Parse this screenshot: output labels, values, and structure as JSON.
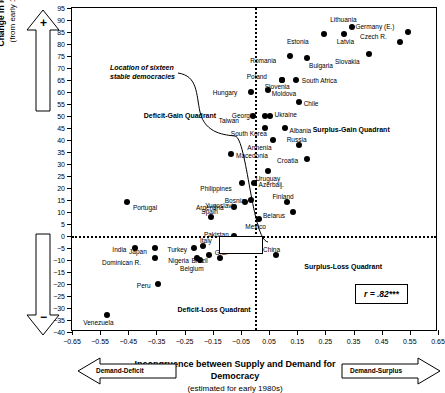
{
  "chart_data": {
    "type": "scatter",
    "title": "",
    "xlabel": "Incongruence between Supply and Demand for Democracy",
    "xlabel_sub": "(estimated for early 1980s)",
    "ylabel": "Change in level of Democracy",
    "ylabel_sub": "(from early 1980s to late 1990s)",
    "xlim": [
      -0.65,
      0.65
    ],
    "ylim": [
      -40,
      95
    ],
    "xticks": [
      -0.65,
      -0.55,
      -0.45,
      -0.35,
      -0.25,
      -0.15,
      -0.05,
      0.05,
      0.15,
      0.25,
      0.35,
      0.45,
      0.55,
      0.65
    ],
    "xticklabels": [
      "-0.65",
      "-0.55",
      "-0.45",
      "-0.35",
      "-0.25",
      "-0.15",
      "-0.05",
      "0.05",
      "0.15",
      "0.25",
      "0.35",
      "0.45",
      "0.55",
      "0.65"
    ],
    "yticks": [
      95,
      90,
      85,
      80,
      75,
      70,
      65,
      60,
      55,
      50,
      45,
      40,
      35,
      30,
      25,
      20,
      15,
      10,
      5,
      0,
      -5,
      -10,
      -15,
      -20,
      -25,
      -30,
      -35,
      -40
    ],
    "yticklabels": [
      "95",
      "90",
      "85",
      "80",
      "75",
      "70",
      "65",
      "60",
      "55",
      "50",
      "45",
      "40",
      "35",
      "30",
      "25",
      "20",
      "15",
      "10",
      "5",
      "0",
      "-5",
      "-10",
      "-15",
      "-20",
      "-25",
      "-30",
      "-35",
      "-40"
    ],
    "grid": false,
    "reference_lines": {
      "x": 0,
      "y": 0,
      "style": "dotted"
    },
    "annotation_r": "r = .82***",
    "points": [
      {
        "label": "Lithuania",
        "x": 0.345,
        "y": 87,
        "lx": -22,
        "ly": -11
      },
      {
        "label": "Germany (E.)",
        "x": 0.545,
        "y": 85,
        "lx": -53,
        "ly": -9
      },
      {
        "label": "Czech R.",
        "x": 0.515,
        "y": 81,
        "lx": -40,
        "ly": -9
      },
      {
        "label": "Latvia",
        "x": 0.315,
        "y": 84,
        "lx": -7,
        "ly": 4
      },
      {
        "label": "Estonia",
        "x": 0.245,
        "y": 84,
        "lx": -37,
        "ly": 4
      },
      {
        "label": "Slovakia",
        "x": 0.405,
        "y": 76,
        "lx": -34,
        "ly": 4
      },
      {
        "label": "Bulgaria",
        "x": 0.185,
        "y": 74,
        "lx": 2,
        "ly": 4
      },
      {
        "label": "Romania",
        "x": 0.125,
        "y": 75,
        "lx": -40,
        "ly": 1
      },
      {
        "label": "South Africa",
        "x": 0.145,
        "y": 65,
        "lx": 6,
        "ly": -3
      },
      {
        "label": "Poland",
        "x": 0.095,
        "y": 65,
        "lx": -35,
        "ly": -7
      },
      {
        "label": "Slovenia",
        "x": 0.095,
        "y": 65,
        "lx": -17,
        "ly": 3
      },
      {
        "label": "Moldova",
        "x": 0.045,
        "y": 61,
        "lx": 4,
        "ly": 0
      },
      {
        "label": "Chile",
        "x": 0.155,
        "y": 56,
        "lx": 5,
        "ly": -2
      },
      {
        "label": "Hungary",
        "x": -0.015,
        "y": 60,
        "lx": -38,
        "ly": -3
      },
      {
        "label": "Georgia",
        "x": 0.035,
        "y": 50,
        "lx": -33,
        "ly": -4
      },
      {
        "label": "Ukraine",
        "x": 0.055,
        "y": 50,
        "lx": 4,
        "ly": -5
      },
      {
        "label": "Taiwan",
        "x": -0.008,
        "y": 50,
        "lx": -34,
        "ly": 1
      },
      {
        "label": "South Korea",
        "x": 0.035,
        "y": 45,
        "lx": -34,
        "ly": 2
      },
      {
        "label": "Albania",
        "x": 0.105,
        "y": 45,
        "lx": 5,
        "ly": -1
      },
      {
        "label": "Armenia",
        "x": 0.065,
        "y": 40,
        "lx": -26,
        "ly": 4
      },
      {
        "label": "Russia",
        "x": 0.155,
        "y": 38,
        "lx": -12,
        "ly": -9
      },
      {
        "label": "Croatia",
        "x": 0.185,
        "y": 32,
        "lx": -30,
        "ly": -2
      },
      {
        "label": "Macedonia",
        "x": -0.085,
        "y": 34,
        "lx": 5,
        "ly": -2
      },
      {
        "label": "Uruguay",
        "x": 0.045,
        "y": 27,
        "lx": -12,
        "ly": 4
      },
      {
        "label": "Azerbaij.",
        "x": -0.005,
        "y": 22,
        "lx": 5,
        "ly": -2
      },
      {
        "label": "Philippines",
        "x": -0.045,
        "y": 22,
        "lx": -42,
        "ly": 2
      },
      {
        "label": "Bosnia",
        "x": -0.015,
        "y": 15,
        "lx": -26,
        "ly": -3
      },
      {
        "label": "Finland",
        "x": 0.115,
        "y": 14,
        "lx": -15,
        "ly": -9
      },
      {
        "label": "Yugoslavia",
        "x": -0.035,
        "y": 14,
        "lx": -40,
        "ly": 0
      },
      {
        "label": "Belarus",
        "x": 0.135,
        "y": 10,
        "lx": -30,
        "ly": 0
      },
      {
        "label": "Argentina",
        "x": -0.075,
        "y": 12,
        "lx": -38,
        "ly": -3
      },
      {
        "label": "Mexico",
        "x": 0.015,
        "y": 7,
        "lx": -14,
        "ly": 4
      },
      {
        "label": "Spain",
        "x": -0.155,
        "y": 8,
        "lx": -10,
        "ly": -9
      },
      {
        "label": "Portugal",
        "x": -0.455,
        "y": 14,
        "lx": 6,
        "ly": 2
      },
      {
        "label": "Pakistan",
        "x": -0.075,
        "y": 0,
        "lx": -30,
        "ly": -5
      },
      {
        "label": "Italy",
        "x": -0.185,
        "y": -4,
        "lx": -3,
        "ly": -9
      },
      {
        "label": "Turkey",
        "x": -0.215,
        "y": -5,
        "lx": -27,
        "ly": -2
      },
      {
        "label": "Japan",
        "x": -0.355,
        "y": -5,
        "lx": -26,
        "ly": 0
      },
      {
        "label": "G.B.",
        "x": -0.125,
        "y": -9,
        "lx": -5,
        "ly": -9
      },
      {
        "label": "Brazil",
        "x": -0.165,
        "y": -8,
        "lx": -17,
        "ly": 2
      },
      {
        "label": "Nigeria",
        "x": -0.205,
        "y": -9,
        "lx": -29,
        "ly": -1
      },
      {
        "label": "Belgium",
        "x": -0.195,
        "y": -10,
        "lx": -20,
        "ly": 5
      },
      {
        "label": "India",
        "x": -0.425,
        "y": -5,
        "lx": -23,
        "ly": -2
      },
      {
        "label": "Dominican R.",
        "x": -0.355,
        "y": -9,
        "lx": -53,
        "ly": 1
      },
      {
        "label": "China",
        "x": 0.075,
        "y": -8,
        "lx": -13,
        "ly": -9
      },
      {
        "label": "Peru",
        "x": -0.345,
        "y": -20,
        "lx": -21,
        "ly": -2
      },
      {
        "label": "Venezuela",
        "x": -0.525,
        "y": -33,
        "lx": -24,
        "ly": 4
      }
    ],
    "quadrants": [
      {
        "name": "deficit-gain",
        "label": "Deficit-Gain Quadrant",
        "x": -0.395,
        "y": 50
      },
      {
        "name": "surplus-gain",
        "label": "Surplus-Gain Quadrant",
        "x": 0.205,
        "y": 44
      },
      {
        "name": "deficit-loss",
        "label": "Deficit-Loss Quadrant",
        "x": -0.275,
        "y": -31
      },
      {
        "name": "surplus-loss",
        "label": "Surplus-Loss Quadrant",
        "x": 0.175,
        "y": -13
      }
    ],
    "annotation": {
      "line1": "Location of sixteen",
      "line2": "stable democracies"
    },
    "arrows": {
      "up": "+",
      "down": "−",
      "left": "Demand-Deficit",
      "right": "Demand-Surplus"
    }
  }
}
